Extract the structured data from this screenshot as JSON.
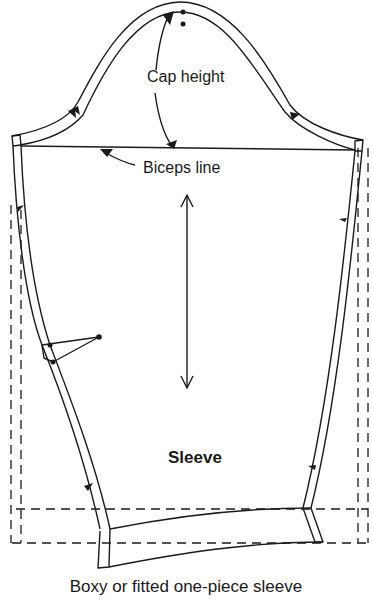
{
  "diagram": {
    "type": "sewing-pattern",
    "piece_label": "Sleeve",
    "caption": "Boxy or fitted one-piece sleeve",
    "annotations": {
      "cap_height": "Cap height",
      "biceps_line": "Biceps line"
    },
    "elements": [
      "sleeve-cap-curve",
      "biceps-line",
      "grainline-arrow",
      "elbow-dart",
      "notches",
      "hem-allowance",
      "dashed-boxy-outline"
    ],
    "colors": {
      "line": "#1a1a1a",
      "background": "#ffffff"
    }
  }
}
